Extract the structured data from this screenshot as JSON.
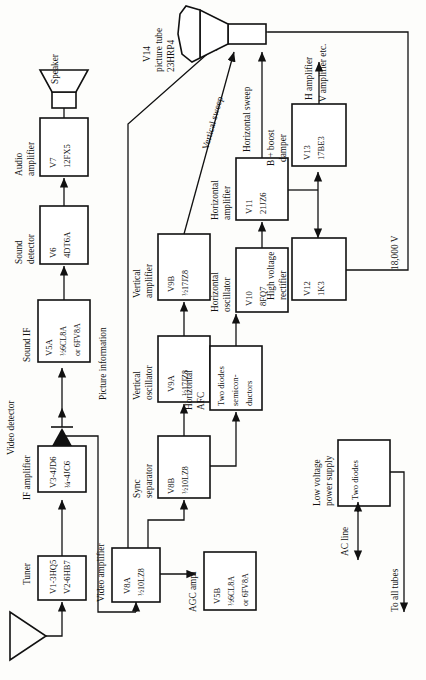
{
  "diagram": {
    "orientation": "rotated-90-ccw",
    "sections": {
      "video_detector": "Video detector",
      "picture_information": "Picture information"
    },
    "blocks": [
      {
        "id": "tuner",
        "caption": "Tuner",
        "line1": "V1-3HQ5",
        "line2": "V2-6HB7"
      },
      {
        "id": "ifamp",
        "caption": "IF amplifier",
        "line1": "V3-4JD6",
        "line2": "¼-4JC6"
      },
      {
        "id": "soundif",
        "caption": "Sound IF",
        "line1": "V5A",
        "line2": "½6CL8A",
        "line3": "or 6FV8A"
      },
      {
        "id": "sounddet",
        "caption": "Sound\ndetector",
        "line1": "V6",
        "line2": "4DT6A"
      },
      {
        "id": "audioamp",
        "caption": "Audio\namplifier",
        "line1": "V7",
        "line2": "12FX5"
      },
      {
        "id": "videoamp",
        "caption": "Video amplifier",
        "line1": "V8A",
        "line2": "½10LZ8"
      },
      {
        "id": "agcamp",
        "caption": "AGC ampl",
        "line1": "V5B",
        "line2": "½6CL8A",
        "line3": "or 6FV8A"
      },
      {
        "id": "syncsep",
        "caption": "Sync\nseparator",
        "line1": "V8B",
        "line2": "½10LZ8"
      },
      {
        "id": "vosc",
        "caption": "Vertical\noscillator",
        "line1": "V9A",
        "line2": "½17JZ8"
      },
      {
        "id": "vamp",
        "caption": "Vertical\namplifier",
        "line1": "V9B",
        "line2": "½17JZ8"
      },
      {
        "id": "hafc",
        "caption": "Horizontal\nAFC",
        "line1": "Two diodes",
        "line2": "semicon-",
        "line3": "ductors"
      },
      {
        "id": "hosc",
        "caption": "Horizontal\noscillator",
        "line1": "V10",
        "line2": "8FQ7"
      },
      {
        "id": "hamp",
        "caption": "Horizontal\namplifier",
        "line1": "V11",
        "line2": "21JZ6"
      },
      {
        "id": "hvrect",
        "caption": "High voltage\nrectifier",
        "line1": "V12",
        "line2": "1K3"
      },
      {
        "id": "damper",
        "caption": "B + boost\ndamper",
        "line1": "V13",
        "line2": "17BE3"
      },
      {
        "id": "lvps",
        "caption": "Low voltage\npower supply",
        "line1": "Two diodes"
      }
    ],
    "crt": {
      "label1": "V14",
      "label2": "picture tube",
      "label3": "23HRP4"
    },
    "speaker_label": "Speaker",
    "signal_labels": {
      "vertical_sweep": "Vertical sweep",
      "horizontal_sweep": "Horizontal sweep",
      "h_amplifier": "H amplifier",
      "v_amplifier": "V amplifier etc.",
      "hv": "18,000 V",
      "ac_line": "AC line",
      "to_all_tubes": "To all tubes"
    },
    "colors": {
      "ink": "#111111",
      "paper": "#fdfdfb"
    }
  }
}
